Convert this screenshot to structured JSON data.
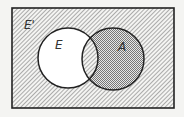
{
  "diagram": {
    "type": "venn",
    "universe_label": "E'",
    "sets": [
      {
        "label": "E",
        "fill": "white"
      },
      {
        "label": "A",
        "fill": "cross-hatch"
      }
    ],
    "regions": {
      "outside": "diagonal-hatch",
      "E_only": "white",
      "E_and_A": "diagonal-hatch",
      "A_only": "cross-hatch"
    },
    "colors": {
      "line": "#222222",
      "background": "#f4f4f2",
      "hatch": "#777777"
    }
  }
}
